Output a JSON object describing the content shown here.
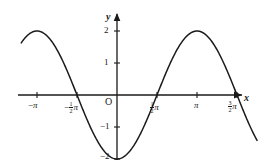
{
  "figure": {
    "background_color": "#ffffff",
    "ink_color": "#1a1a1a",
    "width": 260,
    "height": 165
  },
  "axes": {
    "x_axis_label": "x",
    "y_axis_label": "y",
    "origin_label": "O"
  },
  "x_ticks": [
    {
      "value": -3.14159265,
      "label": "−π",
      "parts": {
        "sign": "−",
        "numerator": "",
        "denominator": "",
        "symbol": "π"
      }
    },
    {
      "value": -1.57079633,
      "label": "−½π",
      "parts": {
        "sign": "−",
        "numerator": "1",
        "denominator": "2",
        "symbol": "π"
      }
    },
    {
      "value": 1.57079633,
      "label": "½π",
      "parts": {
        "sign": "",
        "numerator": "1",
        "denominator": "2",
        "symbol": "π"
      }
    },
    {
      "value": 3.14159265,
      "label": "π",
      "parts": {
        "sign": "",
        "numerator": "",
        "denominator": "",
        "symbol": "π"
      }
    },
    {
      "value": 4.71238898,
      "label": "3/2π",
      "parts": {
        "sign": "",
        "numerator": "3",
        "denominator": "2",
        "symbol": "π"
      }
    }
  ],
  "y_ticks": [
    {
      "value": 2,
      "label": "2"
    },
    {
      "value": 1,
      "label": "1"
    },
    {
      "value": -1,
      "label": "−1"
    },
    {
      "value": -2,
      "label": "−2"
    }
  ],
  "chart_data": {
    "type": "line",
    "title": "",
    "subtitle": "",
    "xlabel": "x",
    "ylabel": "y",
    "function": "y = -2cos(x)",
    "amplitude": 2,
    "period": 6.28318531,
    "xlim": [
      -4.05,
      5.55
    ],
    "ylim": [
      -2.55,
      2.6
    ],
    "grid": false,
    "legend": null,
    "series": [
      {
        "name": "y = -2cos(x)",
        "color": "#1a1a1a",
        "x": [
          -3.76,
          -3.4,
          -3.14159265,
          -2.8,
          -2.5,
          -2.2,
          -1.9,
          -1.57079633,
          -1.2,
          -0.9,
          -0.6,
          -0.3,
          0,
          0.3,
          0.6,
          0.9,
          1.2,
          1.57079633,
          1.9,
          2.2,
          2.5,
          2.8,
          3.14159265,
          3.45,
          3.75,
          4.05,
          4.35,
          4.71238898,
          5.05,
          5.35,
          5.5
        ],
        "y": [
          -1.64,
          -1.93,
          -2.0,
          -1.88,
          -1.6,
          -1.18,
          -0.65,
          0.0,
          0.72,
          1.24,
          1.65,
          1.91,
          2.0,
          1.91,
          1.65,
          1.24,
          0.72,
          0.0,
          -0.65,
          -1.18,
          -1.6,
          -1.88,
          -2.0,
          -1.9,
          -1.64,
          -1.17,
          -0.65,
          0.0,
          0.64,
          1.15,
          1.41
        ]
      }
    ],
    "key_points": {
      "maxima": [
        {
          "x": -3.14159265,
          "y": 2,
          "x_label": "−π"
        },
        {
          "x": 3.14159265,
          "y": 2,
          "x_label": "π"
        }
      ],
      "minima": [
        {
          "x": 0,
          "y": -2,
          "x_label": "0"
        }
      ],
      "zeros": [
        {
          "x": -1.57079633,
          "y": 0,
          "x_label": "−½π"
        },
        {
          "x": 1.57079633,
          "y": 0,
          "x_label": "½π"
        },
        {
          "x": 4.71238898,
          "y": 0,
          "x_label": "3/2π"
        }
      ]
    }
  }
}
